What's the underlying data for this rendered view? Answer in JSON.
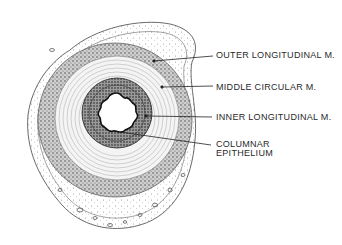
{
  "diagram": {
    "type": "histological cross-section",
    "labels": [
      {
        "id": "outer",
        "text": "OUTER LONGITUDINAL M.",
        "x": 216,
        "y": 50,
        "line_from": [
          154,
          61
        ],
        "line_to": [
          213,
          56
        ]
      },
      {
        "id": "middle",
        "text": "MIDDLE CIRCULAR M.",
        "x": 216,
        "y": 82,
        "line_from": [
          162,
          87
        ],
        "line_to": [
          213,
          86
        ]
      },
      {
        "id": "inner",
        "text": "INNER LONGITUDINAL M.",
        "x": 216,
        "y": 112,
        "line_from": [
          146,
          116
        ],
        "line_to": [
          212,
          117
        ]
      },
      {
        "id": "columnar_line1",
        "text": "COLUMNAR",
        "x": 216,
        "y": 139
      },
      {
        "id": "columnar_line2",
        "text": "EPITHELIUM",
        "x": 216,
        "y": 148,
        "line_from": [
          120,
          132
        ],
        "line_to": [
          211,
          145
        ]
      }
    ],
    "colors": {
      "ink": "#2a2a2a",
      "background": "#ffffff",
      "dark_layer": "#555555",
      "light_fiber": "#9a9a9a"
    }
  }
}
